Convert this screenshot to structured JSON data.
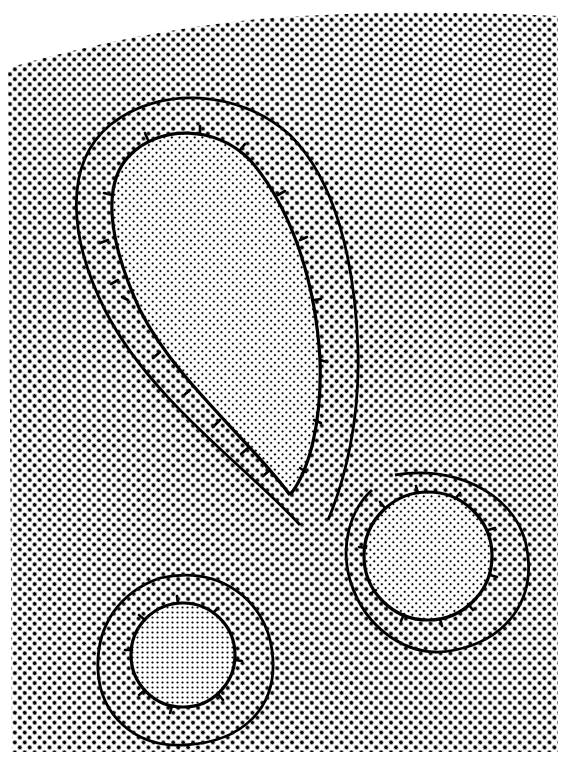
{
  "figure": {
    "colors": {
      "paper": "#ffffff",
      "ink": "#000000"
    },
    "shapes": [
      {
        "name": "teardrop",
        "kind": "loop"
      },
      {
        "name": "right-circle",
        "kind": "circle"
      },
      {
        "name": "left-circle",
        "kind": "circle"
      }
    ]
  }
}
